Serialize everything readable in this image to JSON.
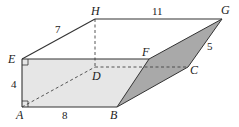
{
  "figure": {
    "vertices": {
      "A": "A",
      "B": "B",
      "C": "C",
      "D": "D",
      "E": "E",
      "F": "F",
      "G": "G",
      "H": "H"
    },
    "edge_lengths": {
      "EH": "7",
      "HG": "11",
      "GC": "5",
      "EA": "4",
      "AB": "8"
    },
    "colors": {
      "front_face": "#e6e6e6",
      "slanted_face": "#a9a9a9",
      "stroke": "#333333"
    }
  }
}
